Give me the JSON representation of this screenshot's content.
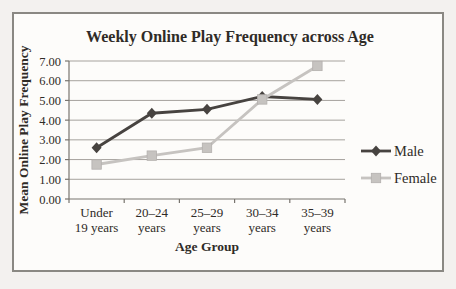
{
  "figure": {
    "border_color": "#8a8883",
    "background": "#fdfcfa",
    "page_background": "#f3f1ef"
  },
  "chart_data": {
    "type": "line",
    "title": "Weekly Online Play Frequency across Age",
    "xlabel": "Age Group",
    "ylabel": "Mean Online Play Frequency",
    "categories": [
      "Under 19 years",
      "20–24 years",
      "25–29 years",
      "30–34 years",
      "35–39 years"
    ],
    "series": [
      {
        "name": "Male",
        "marker": "diamond",
        "color": "#474340",
        "values": [
          2.6,
          4.35,
          4.55,
          5.2,
          5.05
        ]
      },
      {
        "name": "Female",
        "marker": "square",
        "color": "#c6c3c0",
        "values": [
          1.75,
          2.2,
          2.6,
          5.05,
          6.75
        ]
      }
    ],
    "ylim": [
      0,
      7
    ],
    "ytick_step": 1,
    "ytick_labels": [
      "0.00",
      "1.00",
      "2.00",
      "3.00",
      "4.00",
      "5.00",
      "6.00",
      "7.00"
    ],
    "grid": true,
    "legend": {
      "position": "right",
      "entries": [
        "Male",
        "Female"
      ]
    },
    "theme": {
      "grid_color": "#a6a29d",
      "axis_color": "#78746e",
      "text_color": "#2f2b27"
    }
  }
}
